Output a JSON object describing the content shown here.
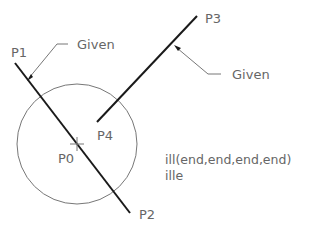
{
  "diagram": {
    "points": [
      {
        "id": "P0",
        "label": "P0",
        "x": 77,
        "y": 144
      },
      {
        "id": "P1",
        "label": "P1",
        "x": 15,
        "y": 63
      },
      {
        "id": "P2",
        "label": "P2",
        "x": 130,
        "y": 213
      },
      {
        "id": "P3",
        "label": "P3",
        "x": 197,
        "y": 16
      },
      {
        "id": "P4",
        "label": "P4",
        "x": 97,
        "y": 122
      }
    ],
    "annotations": {
      "given_1": "Given",
      "given_2": "Given"
    },
    "commands": {
      "line1": "ill(end,end,end,end)",
      "line2": "ille"
    },
    "colors": {
      "line": "#1a1a1a",
      "circle": "#777777",
      "text": "#666666"
    }
  }
}
